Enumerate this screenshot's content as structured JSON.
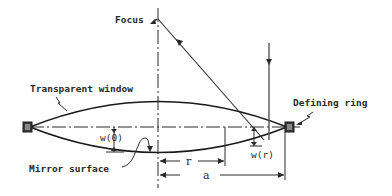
{
  "diagram": {
    "labels": {
      "focus": "Focus",
      "transparent_window": "Transparent window",
      "defining_ring": "Defining ring",
      "mirror_surface": "Mirror surface",
      "w0": "w(0)",
      "wr": "w(r)",
      "r": "r",
      "a": "a"
    },
    "colors": {
      "line": "#2a2a2a",
      "background": "#ffffff"
    }
  }
}
